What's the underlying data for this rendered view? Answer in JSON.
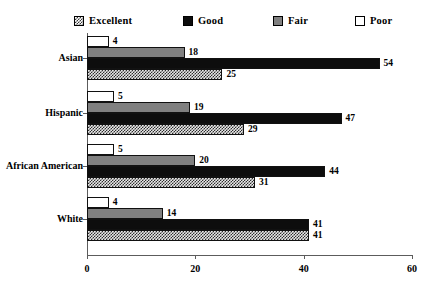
{
  "chart_data": {
    "type": "bar",
    "orientation": "horizontal",
    "stacked": false,
    "title": "",
    "subtitle": "",
    "xlabel": "",
    "ylabel": "",
    "xlim": [
      0,
      60
    ],
    "xticks": [
      0,
      20,
      40,
      60
    ],
    "xtick_labels": [
      "0",
      "20",
      "40",
      "60"
    ],
    "grid": false,
    "legend_position": "top",
    "categories": [
      "Asian",
      "Hispanic",
      "African American",
      "White"
    ],
    "series": [
      {
        "name": "Excellent",
        "color": "#2e2e2e",
        "pattern": "checkered",
        "values": [
          25,
          29,
          31,
          41
        ]
      },
      {
        "name": "Good",
        "color": "#0d0d0d",
        "pattern": "solid",
        "values": [
          54,
          47,
          44,
          41
        ]
      },
      {
        "name": "Fair",
        "color": "#808080",
        "pattern": "solid",
        "values": [
          18,
          19,
          20,
          14
        ]
      },
      {
        "name": "Poor",
        "color": "#ffffff",
        "pattern": "empty",
        "values": [
          4,
          5,
          5,
          4
        ]
      }
    ],
    "series_draw_order": [
      "Poor",
      "Fair",
      "Good",
      "Excellent"
    ]
  },
  "legend": {
    "items": [
      {
        "label": "Excellent",
        "swatch": "checkered-swatch"
      },
      {
        "label": "Good",
        "swatch": "solid-black-swatch"
      },
      {
        "label": "Fair",
        "swatch": "solid-gray-swatch"
      },
      {
        "label": "Poor",
        "swatch": "empty-white-swatch"
      }
    ]
  }
}
